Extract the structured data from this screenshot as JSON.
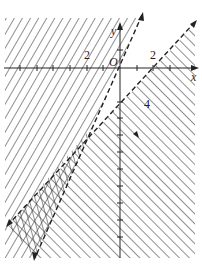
{
  "figure": {
    "type": "linear-inequality-region",
    "axes": {
      "x_label": "x",
      "y_label": "y",
      "origin_label": "O",
      "x_tick_labels": [
        "-2",
        "2"
      ],
      "y_tick_labels": [
        "-4"
      ],
      "x_label_display": "x",
      "y_label_display": "y",
      "neg2_display": "2",
      "pos2_display": "2",
      "neg4_display": "4"
    },
    "lines": [
      {
        "name": "steep-boundary",
        "style": "dashed",
        "passes_through": [
          [
            0,
            0
          ]
        ],
        "description": "steep line through origin"
      },
      {
        "name": "shallow-boundary",
        "style": "dashed",
        "passes_through": [
          [
            2,
            0
          ]
        ],
        "description": "line through (2,0)"
      }
    ],
    "shaded_regions": [
      "left of steep line",
      "right/below of line through (2,0)",
      "overlap wedge at lower left"
    ],
    "colors": {
      "ink": "#222222",
      "background": "#ffffff"
    }
  }
}
